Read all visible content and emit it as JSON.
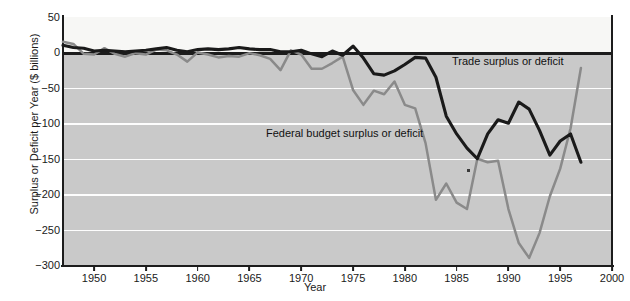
{
  "chart_data": {
    "type": "line",
    "title": "",
    "xlabel": "Year",
    "ylabel": "Surplus or Deficit per Year ($ billions)",
    "xlim": [
      1947,
      2000
    ],
    "ylim": [
      -300,
      50
    ],
    "xticks": [
      1950,
      1955,
      1960,
      1965,
      1970,
      1975,
      1980,
      1985,
      1990,
      1995,
      2000
    ],
    "yticks": [
      50,
      0,
      -50,
      -100,
      -150,
      -200,
      -250,
      -300
    ],
    "grid": "horizontal white gridlines below zero",
    "legend": "inline annotations",
    "series": [
      {
        "name": "Trade surplus or deficit",
        "color": "#1a1a1a",
        "x": [
          1947,
          1948,
          1949,
          1950,
          1951,
          1952,
          1953,
          1954,
          1955,
          1956,
          1957,
          1958,
          1959,
          1960,
          1961,
          1962,
          1963,
          1964,
          1965,
          1966,
          1967,
          1968,
          1969,
          1970,
          1971,
          1972,
          1973,
          1974,
          1975,
          1976,
          1977,
          1978,
          1979,
          1980,
          1981,
          1982,
          1983,
          1984,
          1985,
          1986,
          1987,
          1988,
          1989,
          1990,
          1991,
          1992,
          1993,
          1994,
          1995,
          1996,
          1997
        ],
        "values": [
          10,
          7,
          6,
          2,
          3,
          2,
          1,
          2,
          3,
          5,
          7,
          3,
          1,
          4,
          5,
          4,
          5,
          7,
          5,
          4,
          4,
          1,
          1,
          3,
          -2,
          -6,
          2,
          -4,
          9,
          -8,
          -30,
          -32,
          -26,
          -17,
          -7,
          -8,
          -35,
          -90,
          -115,
          -135,
          -150,
          -115,
          -95,
          -100,
          -70,
          -80,
          -110,
          -145,
          -125,
          -115,
          -155
        ]
      },
      {
        "name": "Federal budget surplus or deficit",
        "color": "#8a8a8a",
        "x": [
          1947,
          1948,
          1949,
          1950,
          1951,
          1952,
          1953,
          1954,
          1955,
          1956,
          1957,
          1958,
          1959,
          1960,
          1961,
          1962,
          1963,
          1964,
          1965,
          1966,
          1967,
          1968,
          1969,
          1970,
          1971,
          1972,
          1973,
          1974,
          1975,
          1976,
          1977,
          1978,
          1979,
          1980,
          1981,
          1982,
          1983,
          1984,
          1985,
          1986,
          1987,
          1988,
          1989,
          1990,
          1991,
          1992,
          1993,
          1994,
          1995,
          1996,
          1997
        ],
        "values": [
          15,
          12,
          -2,
          -3,
          6,
          -2,
          -6,
          -1,
          -3,
          4,
          3,
          -3,
          -13,
          0,
          -3,
          -7,
          -5,
          -6,
          -1,
          -4,
          -9,
          -25,
          3,
          -3,
          -23,
          -23,
          -15,
          -6,
          -53,
          -74,
          -54,
          -59,
          -41,
          -74,
          -79,
          -128,
          -208,
          -185,
          -212,
          -221,
          -150,
          -155,
          -153,
          -221,
          -269,
          -290,
          -255,
          -203,
          -164,
          -107,
          -22
        ]
      }
    ],
    "annotations": [
      {
        "text": "Trade surplus or deficit",
        "x": 1987,
        "y": -25
      },
      {
        "text": "Federal budget surplus or deficit",
        "x": 1976,
        "y": -128
      }
    ]
  },
  "figure": {
    "caption": ""
  }
}
